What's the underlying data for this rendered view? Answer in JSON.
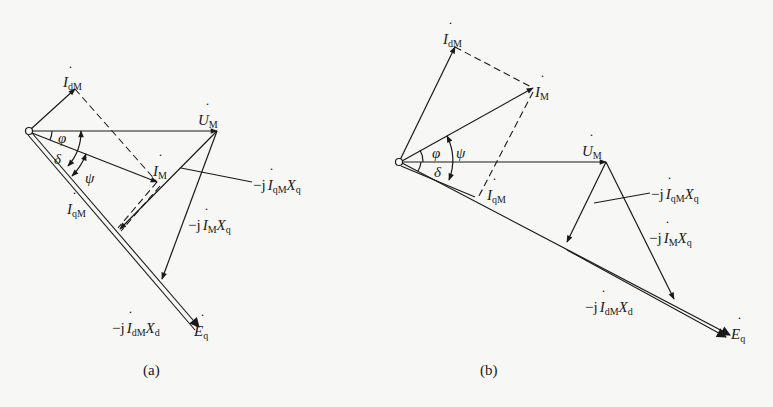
{
  "figure": {
    "captions": {
      "a": "(a)",
      "b": "(b)"
    }
  },
  "labels": {
    "I": "I",
    "U": "U",
    "E": "E",
    "X": "X",
    "dM": "dM",
    "qM": "qM",
    "M": "M",
    "q": "q",
    "d": "d",
    "minus_j": "−j",
    "phi": "φ",
    "delta": "δ",
    "psi": "ψ"
  },
  "diagram_a": {
    "phasors": [
      {
        "name": "I_dM",
        "label": "İdM",
        "from": [
          29,
          131
        ],
        "to": [
          75,
          89
        ]
      },
      {
        "name": "U_M",
        "label": "U̇M",
        "from": [
          29,
          131
        ],
        "to": [
          217,
          131
        ]
      },
      {
        "name": "I_M",
        "label": "İM",
        "from": [
          29,
          131
        ],
        "to": [
          157,
          182
        ]
      },
      {
        "name": "I_qM",
        "label": "İqM",
        "from": [
          29,
          131
        ],
        "to": [
          119,
          230
        ],
        "style": "double"
      },
      {
        "name": "E_q",
        "label": "Ėq",
        "from": [
          29,
          131
        ],
        "to": [
          198,
          328
        ],
        "style": "double"
      },
      {
        "name": "-jI_qM*X_q",
        "label": "−j İqM Xq",
        "from": [
          217,
          131
        ],
        "to": [
          119,
          230
        ]
      },
      {
        "name": "-jI_M*X_q",
        "label": "−j İM Xq",
        "from": [
          217,
          131
        ],
        "to": [
          162,
          280
        ]
      },
      {
        "name": "-jI_dM*X_d",
        "label": "−j İdM Xd",
        "from": [
          162,
          280
        ],
        "to": [
          198,
          328
        ],
        "style": "double"
      }
    ],
    "angles": [
      "φ",
      "δ",
      "ψ"
    ]
  },
  "diagram_b": {
    "phasors": [
      {
        "name": "I_dM",
        "label": "İdM",
        "from": [
          399,
          162
        ],
        "to": [
          455,
          47
        ]
      },
      {
        "name": "I_M",
        "label": "İM",
        "from": [
          399,
          162
        ],
        "to": [
          533,
          88
        ]
      },
      {
        "name": "U_M",
        "label": "U̇M",
        "from": [
          399,
          162
        ],
        "to": [
          606,
          162
        ]
      },
      {
        "name": "I_qM",
        "label": "İqM",
        "from": [
          399,
          162
        ],
        "to": [
          478,
          196
        ],
        "style": "double"
      },
      {
        "name": "E_q",
        "label": "Ėq",
        "from": [
          399,
          162
        ],
        "to": [
          730,
          335
        ]
      },
      {
        "name": "-jI_qM*X_q",
        "label": "−j İqM Xq",
        "from": [
          606,
          162
        ],
        "to": [
          567,
          243
        ]
      },
      {
        "name": "-jI_M*X_q",
        "label": "−j İM Xq",
        "from": [
          606,
          162
        ],
        "to": [
          674,
          300
        ]
      },
      {
        "name": "-jI_dM*X_d",
        "label": "−j İdM Xd",
        "from": [
          567,
          243
        ],
        "to": [
          730,
          335
        ],
        "style": "double"
      }
    ],
    "angles": [
      "φ",
      "ψ",
      "δ"
    ]
  }
}
